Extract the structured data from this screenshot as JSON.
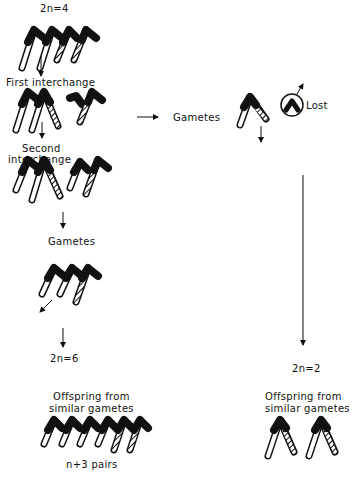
{
  "diagram": {
    "labels": {
      "top_chromosome_number": "2n=4",
      "first_interchange": "First interchange",
      "second_interchange_line1": "Second",
      "second_interchange_line2": "interchange",
      "gametes_left": "Gametes",
      "gametes_right": "Gametes",
      "lost": "Lost",
      "left_result_number": "2n=6",
      "right_result_number": "2n=2",
      "offspring_left_line1": "Offspring from",
      "offspring_left_line2": "similar gametes",
      "offspring_right_line1": "Offspring from",
      "offspring_right_line2": "similar gametes",
      "pairs": "n+3 pairs"
    },
    "legend_patterns": {
      "black": "centromere / chromosome head",
      "white": "open chromosome arm",
      "hatched": "hatched chromosome arm"
    },
    "colors": {
      "ink": "#111111",
      "background": "#ffffff"
    }
  }
}
